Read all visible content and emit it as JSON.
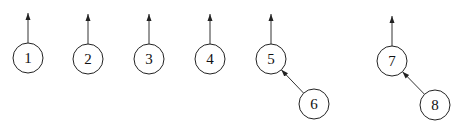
{
  "diagram": {
    "type": "disjoint-set-forest",
    "radius": 15,
    "nodes": [
      {
        "id": "1",
        "label": "1",
        "x": 28,
        "y": 58,
        "root": true
      },
      {
        "id": "2",
        "label": "2",
        "x": 88,
        "y": 59,
        "root": true
      },
      {
        "id": "3",
        "label": "3",
        "x": 149,
        "y": 59,
        "root": true
      },
      {
        "id": "4",
        "label": "4",
        "x": 210,
        "y": 59,
        "root": true
      },
      {
        "id": "5",
        "label": "5",
        "x": 271,
        "y": 59,
        "root": true
      },
      {
        "id": "6",
        "label": "6",
        "x": 314,
        "y": 104,
        "root": false
      },
      {
        "id": "7",
        "label": "7",
        "x": 392,
        "y": 61,
        "root": true
      },
      {
        "id": "8",
        "label": "8",
        "x": 435,
        "y": 105,
        "root": false
      }
    ],
    "edges": [
      {
        "from": "6",
        "to": "5"
      },
      {
        "from": "8",
        "to": "7"
      }
    ],
    "root_arrow_length": 30
  }
}
